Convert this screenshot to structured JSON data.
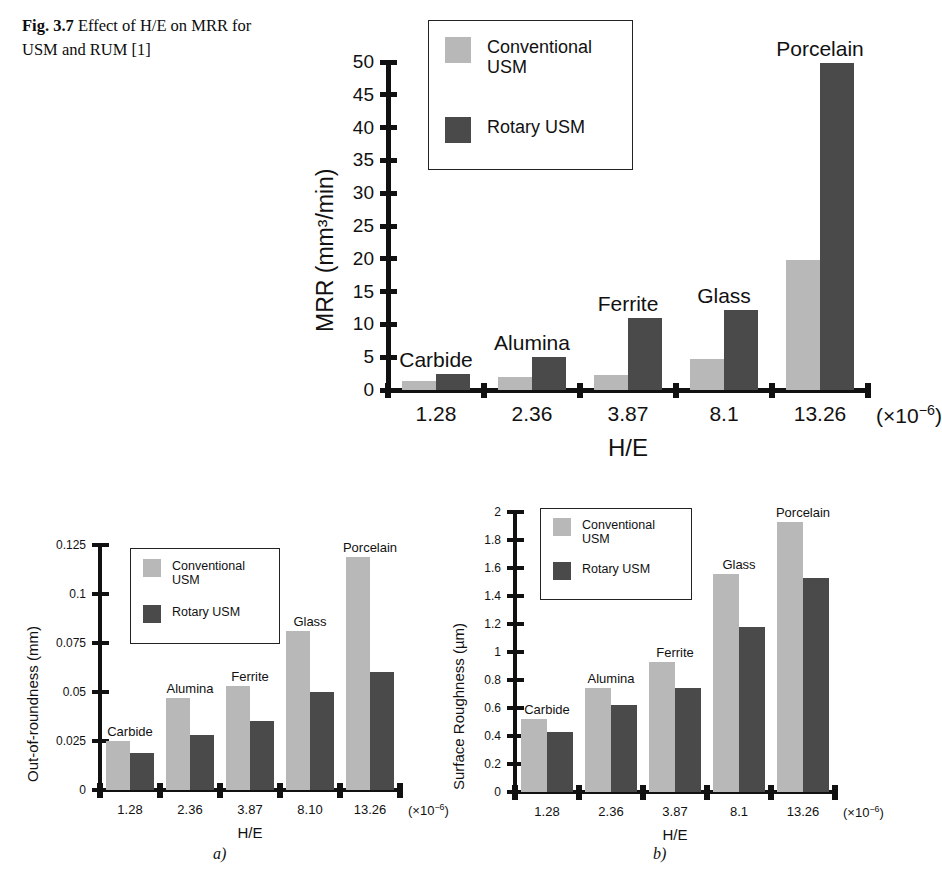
{
  "caption": {
    "figure_number": "Fig. 3.7",
    "text": "Effect of H/E on MRR for USM and RUM [1]"
  },
  "colors": {
    "conventional_usm": "#b8b8b8",
    "rotary_usm": "#4a4a4a",
    "axis": "#111111",
    "background": "#ffffff"
  },
  "legend": {
    "conventional_label": "Conventional\nUSM",
    "rotary_label": "Rotary USM"
  },
  "subfigure_labels": {
    "a": "a)",
    "b": "b)"
  },
  "chart_data": [
    {
      "id": "mrr",
      "type": "bar",
      "title": "",
      "xlabel": "H/E",
      "ylabel": "MRR (mm³/min)",
      "x_multiplier": "(×10⁻⁶)",
      "categories": [
        "1.28",
        "2.36",
        "3.87",
        "8.1",
        "13.26"
      ],
      "point_labels": [
        "Carbide",
        "Alumina",
        "Ferrite",
        "Glass",
        "Porcelain"
      ],
      "ylim": [
        0,
        50
      ],
      "yticks": [
        "0",
        "5",
        "10",
        "15",
        "20",
        "25",
        "30",
        "35",
        "40",
        "45",
        "50"
      ],
      "grid": false,
      "legend_position": "top-right",
      "series": [
        {
          "name": "Conventional USM",
          "values": [
            1.3,
            2.0,
            2.3,
            4.8,
            19.8
          ]
        },
        {
          "name": "Rotary USM",
          "values": [
            2.4,
            5.0,
            11.0,
            12.2,
            49.8
          ]
        }
      ]
    },
    {
      "id": "out-of-roundness",
      "type": "bar",
      "title": "",
      "xlabel": "H/E",
      "ylabel": "Out-of-roundness (mm)",
      "x_multiplier": "(×10⁻⁶)",
      "categories": [
        "1.28",
        "2.36",
        "3.87",
        "8.10",
        "13.26"
      ],
      "point_labels": [
        "Carbide",
        "Alumina",
        "Ferrite",
        "Glass",
        "Porcelain"
      ],
      "ylim": [
        0,
        0.125
      ],
      "yticks": [
        "0",
        "0.025",
        "0.05",
        "0.075",
        "0.1",
        "0.125"
      ],
      "grid": false,
      "legend_position": "top-left",
      "series": [
        {
          "name": "Conventional USM",
          "values": [
            0.025,
            0.047,
            0.053,
            0.081,
            0.119
          ]
        },
        {
          "name": "Rotary USM",
          "values": [
            0.019,
            0.028,
            0.035,
            0.05,
            0.06
          ]
        }
      ]
    },
    {
      "id": "surface-roughness",
      "type": "bar",
      "title": "",
      "xlabel": "H/E",
      "ylabel": "Surface Roughness (µm)",
      "x_multiplier": "(×10⁻⁶)",
      "categories": [
        "1.28",
        "2.36",
        "3.87",
        "8.1",
        "13.26"
      ],
      "point_labels": [
        "Carbide",
        "Alumina",
        "Ferrite",
        "Glass",
        "Porcelain"
      ],
      "ylim": [
        0,
        2
      ],
      "yticks": [
        "0",
        "0.2",
        "0.4",
        "0.6",
        "0.8",
        "1",
        "1.2",
        "1.4",
        "1.6",
        "1.8",
        "2"
      ],
      "grid": false,
      "legend_position": "top-left",
      "series": [
        {
          "name": "Conventional USM",
          "values": [
            0.52,
            0.74,
            0.93,
            1.56,
            1.93
          ]
        },
        {
          "name": "Rotary USM",
          "values": [
            0.43,
            0.62,
            0.74,
            1.18,
            1.53
          ]
        }
      ]
    }
  ]
}
